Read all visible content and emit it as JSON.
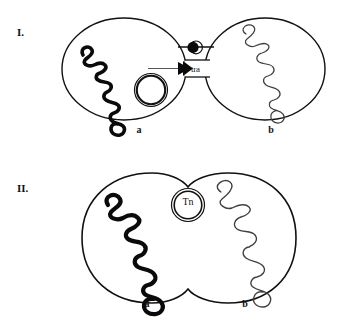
{
  "figure": {
    "background_color": "#ffffff",
    "ink_color": "#111111",
    "panels": [
      {
        "numeral": "I.",
        "description": "two separate bacterial cells joined by a conjugation bridge",
        "cells": [
          {
            "label": "a",
            "role": "donor",
            "chromosome_style": "thick-black-supercoiled",
            "plasmid": {
              "name": "",
              "style": "double-ring"
            }
          },
          {
            "label": "b",
            "role": "recipient",
            "chromosome_style": "thin-gray-supercoiled"
          }
        ],
        "bridge": {
          "label": "tra",
          "pilus_marker": "filled-dot",
          "transfer_arrow": "rightward"
        }
      },
      {
        "numeral": "II.",
        "description": "two fused bacterial cells sharing a transposon element",
        "cells": [
          {
            "label": "a",
            "role": "donor",
            "chromosome_style": "thick-black-supercoiled"
          },
          {
            "label": "b",
            "role": "recipient",
            "chromosome_style": "thin-gray-supercoiled"
          }
        ],
        "element": {
          "label": "Tn",
          "style": "double-ring"
        }
      }
    ]
  },
  "labels": {
    "panel_I_numeral": "I.",
    "panel_II_numeral": "II.",
    "panel_I_cell_a": "a",
    "panel_I_cell_b": "b",
    "panel_II_cell_a": "a",
    "panel_II_cell_b": "b",
    "tra": "tra",
    "tn": "Tn"
  },
  "colors": {
    "outline": "#111111",
    "thick_chromosome": "#0a0a0a",
    "thin_chromosome": "#4a4a4a",
    "background": "#ffffff"
  }
}
